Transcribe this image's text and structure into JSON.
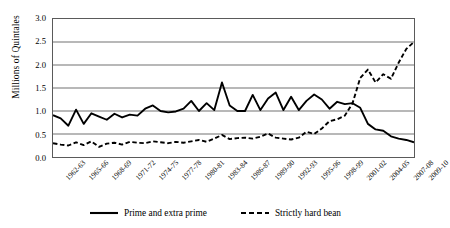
{
  "chart_data": {
    "type": "line",
    "title": "",
    "xlabel": "",
    "ylabel": "Millions of Quintales",
    "ylim": [
      0.0,
      3.0
    ],
    "ytick_labels": [
      "3.0",
      "2.5",
      "2.0",
      "1.5",
      "1.0",
      "0.5",
      "0.0"
    ],
    "ytick_values": [
      3.0,
      2.5,
      2.0,
      1.5,
      1.0,
      0.5,
      0.0
    ],
    "grid": "horizontal",
    "legend_position": "bottom",
    "xtick_labels": [
      "1962-63",
      "1965-66",
      "1968-69",
      "1971-72",
      "1974-75",
      "1977-78",
      "1980-81",
      "1983-84",
      "1986-87",
      "1989-90",
      "1992-93",
      "1995-96",
      "1998-99",
      "2001-02",
      "2004-05",
      "2007-08",
      "2009-10"
    ],
    "xtick_indices": [
      0,
      3,
      6,
      9,
      12,
      15,
      18,
      21,
      24,
      27,
      30,
      33,
      36,
      39,
      42,
      45,
      47
    ],
    "categories": [
      "1962-63",
      "1963-64",
      "1964-65",
      "1965-66",
      "1966-67",
      "1967-68",
      "1968-69",
      "1969-70",
      "1970-71",
      "1971-72",
      "1972-73",
      "1973-74",
      "1974-75",
      "1975-76",
      "1976-77",
      "1977-78",
      "1978-79",
      "1979-80",
      "1980-81",
      "1981-82",
      "1982-83",
      "1983-84",
      "1984-85",
      "1985-86",
      "1986-87",
      "1987-88",
      "1988-89",
      "1989-90",
      "1990-91",
      "1991-92",
      "1992-93",
      "1993-94",
      "1994-95",
      "1995-96",
      "1996-97",
      "1997-98",
      "1998-99",
      "1999-00",
      "2000-01",
      "2001-02",
      "2002-03",
      "2003-04",
      "2004-05",
      "2005-06",
      "2006-07",
      "2007-08",
      "2008-09",
      "2009-10"
    ],
    "series": [
      {
        "name": "Prime and extra prime",
        "style": "solid",
        "color": "#000000",
        "values": [
          0.91,
          0.84,
          0.68,
          1.03,
          0.72,
          0.95,
          0.88,
          0.81,
          0.94,
          0.86,
          0.92,
          0.9,
          1.05,
          1.12,
          1.0,
          0.97,
          0.99,
          1.05,
          1.22,
          1.0,
          1.17,
          1.02,
          1.62,
          1.12,
          1.0,
          1.0,
          1.35,
          1.02,
          1.27,
          1.4,
          1.02,
          1.31,
          1.02,
          1.22,
          1.36,
          1.25,
          1.05,
          1.2,
          1.15,
          1.17,
          1.07,
          0.72,
          0.6,
          0.57,
          0.45,
          0.4,
          0.37,
          0.32
        ]
      },
      {
        "name": "Strictly hard bean",
        "style": "dashed",
        "color": "#000000",
        "values": [
          0.3,
          0.27,
          0.25,
          0.32,
          0.26,
          0.34,
          0.22,
          0.29,
          0.31,
          0.27,
          0.33,
          0.31,
          0.3,
          0.34,
          0.32,
          0.3,
          0.33,
          0.31,
          0.34,
          0.37,
          0.33,
          0.4,
          0.48,
          0.39,
          0.41,
          0.42,
          0.4,
          0.44,
          0.51,
          0.42,
          0.4,
          0.38,
          0.42,
          0.55,
          0.5,
          0.62,
          0.78,
          0.82,
          0.9,
          1.17,
          1.72,
          1.9,
          1.62,
          1.8,
          1.7,
          2.05,
          2.35,
          2.5
        ]
      }
    ]
  }
}
